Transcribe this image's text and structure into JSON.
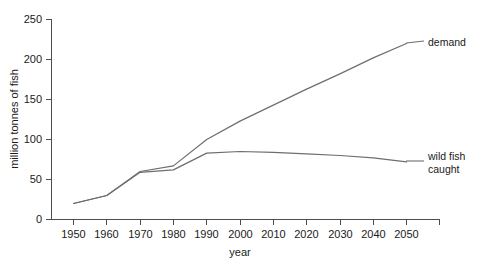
{
  "chart_data": {
    "type": "line",
    "title": "",
    "xlabel": "year",
    "ylabel": "million tonnes of fish",
    "x": [
      1950,
      1960,
      1970,
      1980,
      1990,
      2000,
      2010,
      2020,
      2030,
      2040,
      2050
    ],
    "xlim": [
      1944,
      1955
    ],
    "xticks": [
      "1950",
      "1960",
      "1970",
      "1980",
      "1990",
      "2000",
      "2010",
      "2020",
      "2030",
      "2040",
      "2050"
    ],
    "yticks": [
      "0",
      "50",
      "100",
      "150",
      "200",
      "250"
    ],
    "ylim": [
      0,
      250
    ],
    "grid": false,
    "legend_position": "right-inline-labels",
    "series": [
      {
        "name": "demand",
        "color": "#6e6e6e",
        "values": [
          20,
          30,
          60,
          67,
          100,
          123,
          143,
          163,
          182,
          202,
          220
        ]
      },
      {
        "name": "wild fish caught",
        "color": "#6e6e6e",
        "values": [
          20,
          30,
          59,
          62,
          83,
          85,
          84,
          82,
          80,
          77,
          72
        ]
      }
    ],
    "annotations": [
      {
        "text": "demand",
        "for_series": "demand",
        "at_x": 2050
      },
      {
        "text": "wild fish",
        "for_series": "wild fish caught",
        "at_x": 2050
      },
      {
        "text": "caught",
        "for_series": "wild fish caught",
        "at_x": 2050
      }
    ]
  },
  "axes": {
    "y_axis_title": "million tonnes of fish",
    "x_axis_title": "year"
  },
  "labels": {
    "demand": "demand",
    "wild_fish_line1": "wild fish",
    "wild_fish_line2": "caught"
  }
}
